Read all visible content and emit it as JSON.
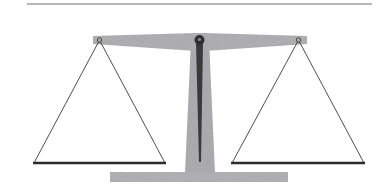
{
  "illustration": {
    "subject": "balance scale",
    "balanced": true,
    "colors": {
      "background": "#ffffff",
      "top_rule": "#6e6e6e",
      "beam": "#b4b3b8",
      "pillar": "#b1b0b5",
      "base": "#b6b5ba",
      "pivot": "#2f2f31",
      "needle": "#3a3a3c",
      "string": "#3c3c3c",
      "pan": "#2c2c2c",
      "hook": "#4a4a4a"
    }
  }
}
